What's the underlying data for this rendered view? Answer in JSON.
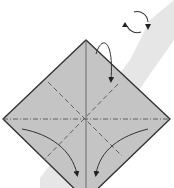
{
  "diagram": {
    "type": "origami-fold-instructions",
    "colors": {
      "background": "#ffffff",
      "band": "#e8e8e8",
      "paper": "#c4c4c4",
      "outline": "#333333",
      "lines": "#444444"
    },
    "elements": [
      {
        "name": "rotate-symbol",
        "meaning": "turn model over / rotate"
      },
      {
        "name": "paper-diamond",
        "meaning": "square paper, corner up"
      },
      {
        "name": "vertical-crease",
        "style": "solid thin"
      },
      {
        "name": "horizontal-mountain-fold",
        "style": "dash-dot"
      },
      {
        "name": "valley-fold-left-diagonal",
        "style": "dashed"
      },
      {
        "name": "valley-fold-right-diagonal",
        "style": "dashed"
      },
      {
        "name": "fold-arrow-top",
        "meaning": "fold top point down behind"
      },
      {
        "name": "fold-arrow-left",
        "meaning": "fold left corner to bottom"
      },
      {
        "name": "fold-arrow-right",
        "meaning": "fold right corner to bottom"
      }
    ]
  }
}
